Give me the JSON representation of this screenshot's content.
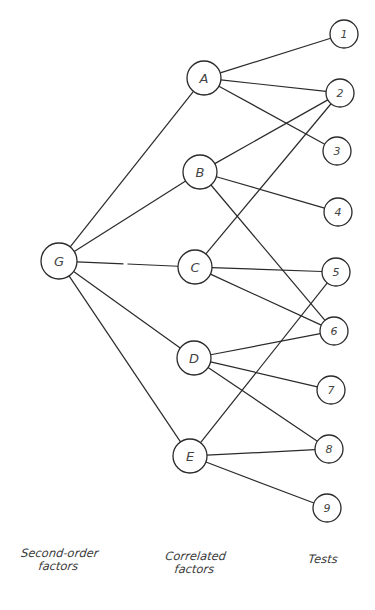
{
  "diagram": {
    "title": "",
    "stroke_color": "#2a2a2a",
    "background": "#ffffff",
    "nodes": {
      "G": {
        "label": "G",
        "x": 59,
        "y": 261,
        "r": 18,
        "level": "second-order"
      },
      "A": {
        "label": "A",
        "x": 204,
        "y": 78,
        "r": 17,
        "level": "correlated"
      },
      "B": {
        "label": "B",
        "x": 200,
        "y": 172,
        "r": 17,
        "level": "correlated"
      },
      "C": {
        "label": "C",
        "x": 195,
        "y": 267,
        "r": 17,
        "level": "correlated"
      },
      "D": {
        "label": "D",
        "x": 194,
        "y": 358,
        "r": 17,
        "level": "correlated"
      },
      "E": {
        "label": "E",
        "x": 190,
        "y": 456,
        "r": 17,
        "level": "correlated"
      },
      "T1": {
        "label": "1",
        "x": 344,
        "y": 34,
        "r": 14,
        "level": "test"
      },
      "T2": {
        "label": "2",
        "x": 340,
        "y": 93,
        "r": 14,
        "level": "test"
      },
      "T3": {
        "label": "3",
        "x": 337,
        "y": 151,
        "r": 14,
        "level": "test"
      },
      "T4": {
        "label": "4",
        "x": 338,
        "y": 212,
        "r": 14,
        "level": "test"
      },
      "T5": {
        "label": "5",
        "x": 336,
        "y": 272,
        "r": 14,
        "level": "test"
      },
      "T6": {
        "label": "6",
        "x": 334,
        "y": 331,
        "r": 14,
        "level": "test"
      },
      "T7": {
        "label": "7",
        "x": 331,
        "y": 390,
        "r": 14,
        "level": "test"
      },
      "T8": {
        "label": "8",
        "x": 329,
        "y": 449,
        "r": 14,
        "level": "test"
      },
      "T9": {
        "label": "9",
        "x": 327,
        "y": 508,
        "r": 14,
        "level": "test"
      }
    },
    "edges": [
      {
        "from": "G",
        "to": "A"
      },
      {
        "from": "G",
        "to": "B"
      },
      {
        "from": "G",
        "to": "C",
        "broken": true
      },
      {
        "from": "G",
        "to": "D"
      },
      {
        "from": "G",
        "to": "E"
      },
      {
        "from": "A",
        "to": "T1"
      },
      {
        "from": "A",
        "to": "T2"
      },
      {
        "from": "A",
        "to": "T3"
      },
      {
        "from": "B",
        "to": "T2"
      },
      {
        "from": "B",
        "to": "T4"
      },
      {
        "from": "B",
        "to": "T6"
      },
      {
        "from": "C",
        "to": "T2"
      },
      {
        "from": "C",
        "to": "T5"
      },
      {
        "from": "C",
        "to": "T6"
      },
      {
        "from": "D",
        "to": "T6"
      },
      {
        "from": "D",
        "to": "T7"
      },
      {
        "from": "D",
        "to": "T8"
      },
      {
        "from": "E",
        "to": "T5"
      },
      {
        "from": "E",
        "to": "T8"
      },
      {
        "from": "E",
        "to": "T9"
      }
    ],
    "column_labels": {
      "second_order": {
        "line1": "Second-order",
        "line2": "factors"
      },
      "correlated": {
        "line1": "Correlated",
        "line2": "factors"
      },
      "tests": {
        "line1": "Tests"
      }
    }
  }
}
